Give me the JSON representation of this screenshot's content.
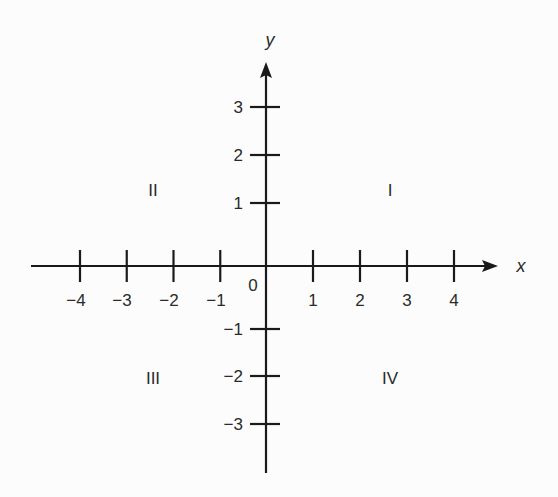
{
  "diagram": {
    "axes": {
      "x": {
        "name": "x",
        "ticks": [
          "−4",
          "−3",
          "−2",
          "−1",
          "1",
          "2",
          "3",
          "4"
        ],
        "tick_values": [
          -4,
          -3,
          -2,
          -1,
          1,
          2,
          3,
          4
        ]
      },
      "y": {
        "name": "y",
        "ticks": [
          "3",
          "2",
          "1",
          "−1",
          "−2",
          "−3"
        ],
        "tick_values": [
          3,
          2,
          1,
          -1,
          -2,
          -3
        ]
      },
      "origin_label": "0"
    },
    "quadrants": {
      "I": "I",
      "II": "II",
      "III": "III",
      "IV": "IV"
    },
    "colors": {
      "line": "#1a1a1a",
      "text": "#2a2a2a",
      "background": "#fcfcfc"
    }
  }
}
